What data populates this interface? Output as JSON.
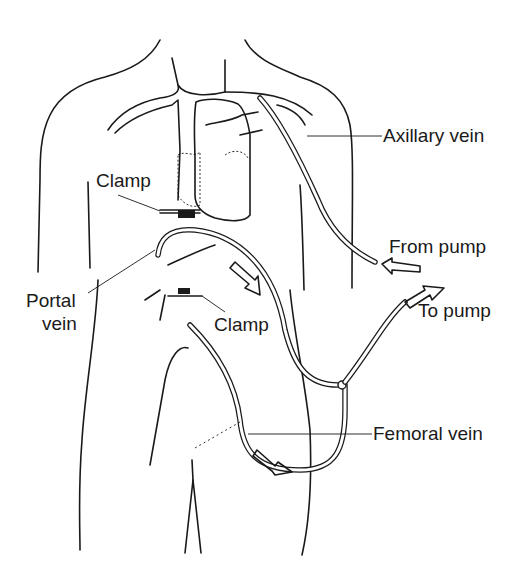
{
  "diagram": {
    "labels": {
      "axillary_vein": "Axillary vein",
      "clamp_upper": "Clamp",
      "from_pump": "From pump",
      "to_pump": "To pump",
      "portal_vein_line1": "Portal",
      "portal_vein_line2": "vein",
      "clamp_lower": "Clamp",
      "femoral_vein": "Femoral vein"
    },
    "colors": {
      "ink": "#1a1a1a",
      "background": "#ffffff"
    }
  }
}
